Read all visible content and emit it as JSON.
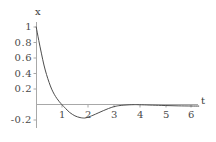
{
  "figure": {
    "background_color": "#ffffff",
    "axis_color": "#a8a8a8",
    "curve_color": "#4d4d4d",
    "text_color": "#4a4a4a",
    "width": 216,
    "height": 142
  },
  "axes": {
    "x_axis_name": "t",
    "y_axis_name": "x",
    "x_ticks": [
      {
        "value": 1,
        "label": "1",
        "px": 62
      },
      {
        "value": 2,
        "label": "2",
        "px": 88
      },
      {
        "value": 3,
        "label": "3",
        "px": 114
      },
      {
        "value": 4,
        "label": "4",
        "px": 140
      },
      {
        "value": 5,
        "label": "5",
        "px": 166
      },
      {
        "value": 6,
        "label": "6",
        "px": 191
      }
    ],
    "y_ticks": [
      {
        "value": 1,
        "label": "1",
        "px": 27
      },
      {
        "value": 0.8,
        "label": "0.8",
        "px": 42
      },
      {
        "value": 0.6,
        "label": "0.6",
        "px": 58
      },
      {
        "value": 0.4,
        "label": "0.4",
        "px": 73
      },
      {
        "value": 0.2,
        "label": "0.2",
        "px": 89
      },
      {
        "value": -0.2,
        "label": "-0.2",
        "px": 122
      }
    ]
  },
  "chart_data": {
    "type": "line",
    "title": "",
    "xlabel": "t",
    "ylabel": "x",
    "xlim": [
      0,
      6.4
    ],
    "ylim": [
      -0.22,
      1.05
    ],
    "grid": false,
    "legend": "none",
    "series": [
      {
        "name": "x(t)",
        "x": [
          0.0,
          0.1,
          0.2,
          0.3,
          0.4,
          0.5,
          0.6,
          0.7,
          0.8,
          0.9,
          1.0,
          1.05,
          1.1,
          1.2,
          1.3,
          1.4,
          1.5,
          1.6,
          1.7,
          1.8,
          1.85,
          1.9,
          2.0,
          2.1,
          2.2,
          2.4,
          2.6,
          2.8,
          3.0,
          3.1,
          3.2,
          3.4,
          3.6,
          3.8,
          3.9,
          4.0,
          4.2,
          4.5,
          5.0,
          5.5,
          6.0,
          6.3
        ],
        "y": [
          1.0,
          0.83,
          0.67,
          0.52,
          0.4,
          0.3,
          0.215,
          0.15,
          0.098,
          0.055,
          0.018,
          0.0,
          -0.015,
          -0.05,
          -0.08,
          -0.103,
          -0.122,
          -0.135,
          -0.144,
          -0.149,
          -0.15,
          -0.149,
          -0.14,
          -0.128,
          -0.115,
          -0.086,
          -0.057,
          -0.03,
          -0.007,
          0.0,
          0.006,
          0.013,
          0.017,
          0.019,
          0.019,
          0.018,
          0.016,
          0.013,
          0.008,
          0.004,
          0.002,
          0.001
        ]
      }
    ]
  }
}
